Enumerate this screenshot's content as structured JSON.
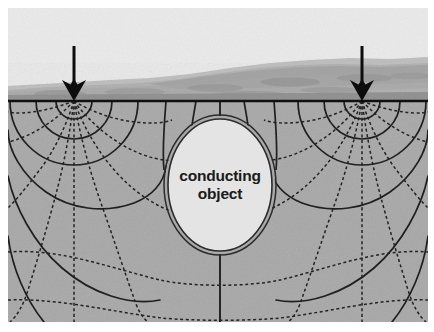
{
  "figure": {
    "name": "resistivity-survey-cross-section",
    "width": 434,
    "height": 332,
    "background_color": "#ffffff"
  },
  "photo": {
    "name": "landscape-photograph",
    "sky_color": "#ebebeb",
    "hill_color": "#b4b4b4",
    "hill_shadow_color": "#9e9e9e",
    "foreground_band_color": "#8f8f8f",
    "horizon_top_y": 62,
    "description": "grayscale photograph of low hills and sky above the ground surface"
  },
  "ground": {
    "name": "ground-surface-line",
    "surface_y": 101,
    "line_color": "#101010",
    "line_width": 2.6,
    "subsurface_color": "#a8a8a8",
    "subsurface_texture_color": "#9b9b9b"
  },
  "electrodes": [
    {
      "name": "left-current-electrode",
      "label": "",
      "x": 74,
      "tip_y": 101,
      "arrow_top_y": 46
    },
    {
      "name": "right-current-electrode",
      "label": "",
      "x": 362,
      "tip_y": 101,
      "arrow_top_y": 46
    }
  ],
  "arrow": {
    "name": "current-injection-arrow",
    "color": "#0d0d0d",
    "shaft_width": 3.0,
    "head_half_width": 12,
    "head_height": 20,
    "barb_inset": 7
  },
  "object": {
    "name": "conducting-object",
    "label_line1": "conducting",
    "label_line2": "object",
    "center_x": 220,
    "center_y": 185,
    "radius_x": 52,
    "radius_y": 66,
    "fill_color": "#e4e4e4",
    "outline_color": "#2b2b2b",
    "outline_width": 1.6,
    "outline_style": "double",
    "outline_gap": 4
  },
  "field_lines": {
    "equipotential": {
      "name": "equipotential-lines",
      "style": "solid",
      "color": "#1f1f1f",
      "width": 1.7,
      "count_per_electrode": 5
    },
    "current_flow": {
      "name": "current-flow-lines",
      "style": "dashed",
      "color": "#232323",
      "width": 1.5,
      "dash_pattern": "3,2.6",
      "count_per_electrode": 9
    },
    "center_axis": {
      "name": "center-axis-line",
      "style": "solid",
      "color": "#1f1f1f",
      "x": 220
    }
  },
  "legend_semantics": {
    "solid_lines_meaning": "equipotential lines",
    "dashed_lines_meaning": "current flow lines",
    "arrows_meaning": "current injection electrodes"
  }
}
